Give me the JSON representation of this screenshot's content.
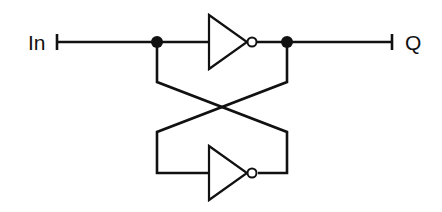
{
  "diagram": {
    "type": "circuit",
    "labels": {
      "input": "In",
      "output": "Q"
    },
    "components": [
      {
        "id": "inverter-top",
        "kind": "NOT gate",
        "orientation": "right"
      },
      {
        "id": "inverter-bottom",
        "kind": "NOT gate",
        "orientation": "right"
      }
    ],
    "junctions": [
      {
        "id": "junction-left"
      },
      {
        "id": "junction-right"
      }
    ],
    "colors": {
      "stroke": "#111111",
      "background": "#ffffff"
    }
  }
}
